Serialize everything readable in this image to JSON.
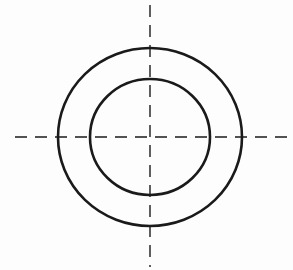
{
  "diagram": {
    "title": "Concentric circles with centerlines",
    "stroke_color": "#1a1a1a",
    "background_color": "#fdfdfd",
    "center": {
      "x": 150,
      "y": 137
    },
    "outer_circle": {
      "rx": 92,
      "ry": 89,
      "stroke_width": 2.6
    },
    "inner_circle": {
      "rx": 60,
      "ry": 58,
      "stroke_width": 2.6
    },
    "horizontal_centerline": {
      "x1": 15,
      "x2": 287,
      "y": 137,
      "dash": "12 8",
      "stroke_width": 1.4
    },
    "vertical_centerline": {
      "x": 150,
      "y1": 5,
      "y2": 267,
      "dash": "12 8",
      "stroke_width": 1.4
    }
  }
}
